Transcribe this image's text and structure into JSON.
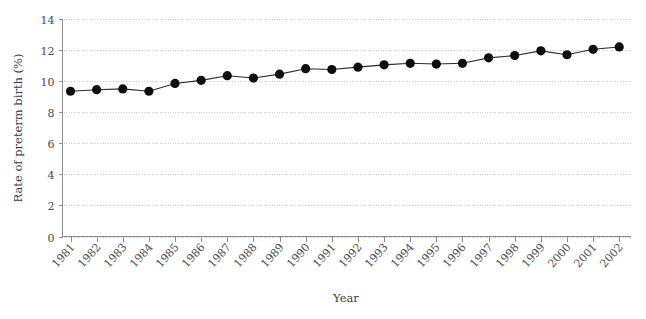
{
  "chart_data": {
    "type": "line",
    "title": "",
    "xlabel": "Year",
    "ylabel": "Rate of preterm birth (%)",
    "xlim": [
      1980.5,
      2002.8
    ],
    "ylim": [
      0,
      14
    ],
    "ytick_labels": [
      "0",
      "2",
      "4",
      "6",
      "8",
      "10",
      "12",
      "14"
    ],
    "ytick_values": [
      0,
      2,
      4,
      6,
      8,
      10,
      12,
      14
    ],
    "grid": true,
    "legend": "none",
    "marker": "filled-circle",
    "categories": [
      "1981",
      "1982",
      "1983",
      "1984",
      "1985",
      "1986",
      "1987",
      "1988",
      "1989",
      "1990",
      "1991",
      "1992",
      "1993",
      "1994",
      "1995",
      "1996",
      "1997",
      "1998",
      "1999",
      "2000",
      "2001",
      "2002"
    ],
    "x": [
      1981,
      1982,
      1983,
      1984,
      1985,
      1986,
      1987,
      1988,
      1989,
      1990,
      1991,
      1992,
      1993,
      1994,
      1995,
      1996,
      1997,
      1998,
      1999,
      2000,
      2001,
      2002
    ],
    "values": [
      9.35,
      9.45,
      9.5,
      9.35,
      9.85,
      10.05,
      10.35,
      10.2,
      10.45,
      10.8,
      10.75,
      10.9,
      11.05,
      11.15,
      11.1,
      11.15,
      11.5,
      11.65,
      11.95,
      11.7,
      12.05,
      12.2
    ],
    "series": [
      {
        "name": "Rate of preterm birth",
        "values": [
          9.35,
          9.45,
          9.5,
          9.35,
          9.85,
          10.05,
          10.35,
          10.2,
          10.45,
          10.8,
          10.75,
          10.9,
          11.05,
          11.15,
          11.1,
          11.15,
          11.5,
          11.65,
          11.95,
          11.7,
          12.05,
          12.2
        ],
        "color": "#0d0d0d"
      }
    ]
  },
  "colors": {
    "marker": "#0d0d0d",
    "line": "#2b2b2b",
    "grid": "#c9c9c9",
    "axis": "#8d8d8d",
    "text": "#4a4a4a",
    "background": "#ffffff"
  }
}
